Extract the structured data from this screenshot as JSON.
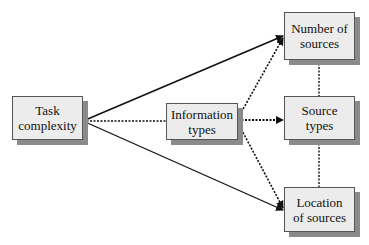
{
  "nodes": {
    "task_complexity": {
      "label": "Task\ncomplexity"
    },
    "information_types": {
      "label": "Information\ntypes"
    },
    "number_of_sources": {
      "label": "Number of\nsources"
    },
    "source_types": {
      "label": "Source\ntypes"
    },
    "location_of_sources": {
      "label": "Location\nof sources"
    }
  },
  "edges": [
    {
      "from": "Task complexity",
      "to": "Number of sources",
      "style": "solid",
      "arrow": true
    },
    {
      "from": "Task complexity",
      "to": "Location of sources",
      "style": "solid",
      "arrow": true
    },
    {
      "from": "Task complexity",
      "to": "Information types",
      "style": "dotted",
      "arrow": false
    },
    {
      "from": "Information types",
      "to": "Number of sources",
      "style": "dotted",
      "arrow": true
    },
    {
      "from": "Information types",
      "to": "Source types",
      "style": "dotted",
      "arrow": true
    },
    {
      "from": "Information types",
      "to": "Location of sources",
      "style": "dotted",
      "arrow": true
    },
    {
      "from": "Number of sources",
      "to": "Source types",
      "style": "dotted",
      "arrow": false
    },
    {
      "from": "Source types",
      "to": "Location of sources",
      "style": "dotted",
      "arrow": false
    }
  ],
  "colors": {
    "box_fill": "#ececec",
    "box_border": "#555555",
    "shadow": "#8a8a8a",
    "line": "#111111"
  }
}
